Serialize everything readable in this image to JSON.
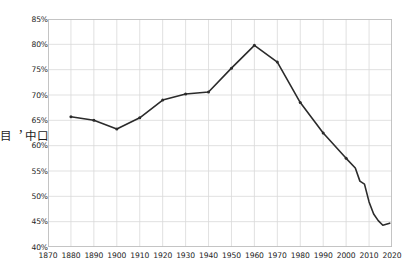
{
  "chart_data": {
    "type": "line",
    "title": "",
    "subtitle": "",
    "xlabel": "",
    "ylabel": "30至44歲成年人口中，目前已婚的人數比例",
    "ylabel_vertical_text": "30\n至\n44\n歲\n成\n年\n人\n口\n中\n，\n目\n前\n已\n婚\n的\n人\n數\n比\n例",
    "xlim": [
      1870,
      2020
    ],
    "ylim": [
      40,
      85
    ],
    "grid": true,
    "legend": "none",
    "line_color": "#2b2b2b",
    "grid_color": "#d9d9d9",
    "axis_text_color": "#1d1d1d",
    "x_ticks": [
      1870,
      1880,
      1890,
      1900,
      1910,
      1920,
      1930,
      1940,
      1950,
      1960,
      1970,
      1980,
      1990,
      2000,
      2010,
      2020
    ],
    "x_tick_labels": [
      "1870",
      "1880",
      "1890",
      "1900",
      "1910",
      "1920",
      "1930",
      "1940",
      "1950",
      "1960",
      "1970",
      "1980",
      "1990",
      "2000",
      "2010",
      "2020"
    ],
    "y_ticks": [
      40,
      45,
      50,
      55,
      60,
      65,
      70,
      75,
      80,
      85
    ],
    "y_tick_labels": [
      "40%",
      "45%",
      "50%",
      "55%",
      "60%",
      "65%",
      "70%",
      "75%",
      "80%",
      "85%"
    ],
    "x": [
      1880,
      1890,
      1900,
      1910,
      1920,
      1930,
      1940,
      1950,
      1960,
      1970,
      1980,
      1990,
      2000,
      2004,
      2006,
      2008,
      2010,
      2012,
      2014,
      2016,
      2019
    ],
    "values": [
      65.7,
      65.0,
      63.3,
      65.5,
      69.0,
      70.2,
      70.6,
      75.3,
      79.8,
      76.5,
      68.5,
      62.5,
      57.5,
      55.6,
      53.0,
      52.4,
      48.9,
      46.5,
      45.2,
      44.3,
      44.7
    ],
    "markers": [
      1880,
      1890,
      1900,
      1910,
      1920,
      1930,
      1940,
      1950,
      1960,
      1970,
      1980,
      1990,
      2000
    ]
  }
}
